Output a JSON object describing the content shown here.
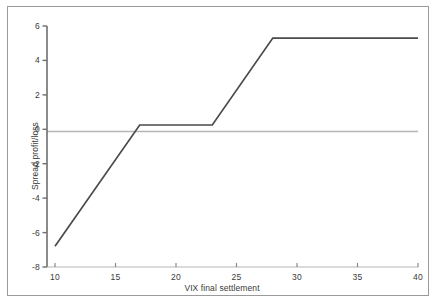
{
  "chart_data": {
    "type": "line",
    "title": "",
    "subtitle": "",
    "xlabel": "VIX final settlement",
    "ylabel": "Spread profit/loss",
    "xlim": [
      10,
      40
    ],
    "ylim": [
      -8,
      6
    ],
    "xticks": [
      "10",
      "15",
      "20",
      "25",
      "30",
      "35",
      "40"
    ],
    "xtick_values": [
      10,
      15,
      20,
      25,
      30,
      35,
      40
    ],
    "yticks": [
      "6",
      "4",
      "2",
      "0",
      "-2",
      "-4",
      "-6",
      "-8"
    ],
    "ytick_values": [
      6,
      4,
      2,
      0,
      -2,
      -4,
      -6,
      -8
    ],
    "grid": false,
    "legend": null,
    "zero_line": 0,
    "series": [
      {
        "name": "Spread profit/loss",
        "color": "#4a4a4a",
        "x": [
          10,
          17,
          23,
          28,
          40
        ],
        "values": [
          -6.8,
          0.25,
          0.25,
          5.3,
          5.3
        ]
      }
    ],
    "annotations": []
  },
  "colors": {
    "line": "#4a4a4a",
    "axis": "#6e6e6e",
    "zero_line": "#b5b5b5",
    "frame": "#9a9a9a",
    "text": "#3a3a3a",
    "background": "#ffffff"
  },
  "icons": {
    "chart_icon": "line-chart-icon"
  }
}
